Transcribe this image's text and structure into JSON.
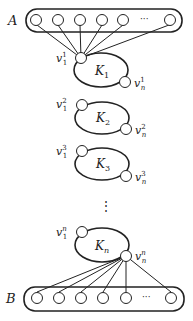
{
  "set_a": {
    "label": "A",
    "ellipsis": "···"
  },
  "set_b": {
    "label": "B",
    "ellipsis": "···"
  },
  "dots": "⋮",
  "loops": [
    {
      "name": "K",
      "sub": "1",
      "v1": "v",
      "v1_sub": "1",
      "v1_sup": "1",
      "vn": "v",
      "vn_sub": "n",
      "vn_sup": "1"
    },
    {
      "name": "K",
      "sub": "2",
      "v1": "v",
      "v1_sub": "1",
      "v1_sup": "2",
      "vn": "v",
      "vn_sub": "n",
      "vn_sup": "2"
    },
    {
      "name": "K",
      "sub": "3",
      "v1": "v",
      "v1_sub": "1",
      "v1_sup": "3",
      "vn": "v",
      "vn_sub": "n",
      "vn_sup": "3"
    },
    {
      "name": "K",
      "sub": "n",
      "v1": "v",
      "v1_sub": "1",
      "v1_sup": "n",
      "vn": "v",
      "vn_sub": "n",
      "vn_sup": "n"
    }
  ],
  "colors": {
    "stroke": "#222222",
    "background": "#ffffff"
  }
}
